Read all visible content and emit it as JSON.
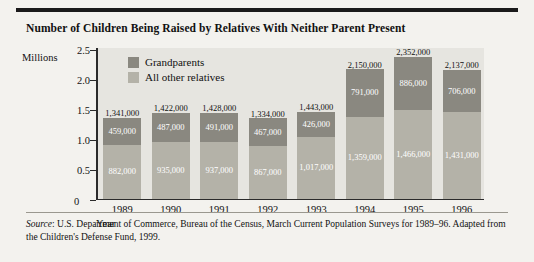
{
  "chart_data": {
    "type": "bar",
    "stacked": true,
    "title": "Number of Children Being Raised by Relatives With Neither Parent Present",
    "xlabel": "Year",
    "ylabel": "Millions",
    "ylim": [
      0,
      2.5
    ],
    "yticks": [
      "0",
      "0.5",
      "1.0",
      "1.5",
      "2.0",
      "2.5"
    ],
    "ytick_values": [
      0,
      0.5,
      1.0,
      1.5,
      2.0,
      2.5
    ],
    "grid": false,
    "legend_position": "inside-top-left",
    "categories": [
      "1989",
      "1990",
      "1991",
      "1992",
      "1993",
      "1994",
      "1995",
      "1996"
    ],
    "series": [
      {
        "name": "Grandparents",
        "color": "#8a8880",
        "values": [
          882000,
          935000,
          937000,
          867000,
          1017000,
          1359000,
          1466000,
          1431000
        ],
        "labels": [
          "882,000",
          "935,000",
          "937,000",
          "867,000",
          "1,017,000",
          "1,359,000",
          "1,466,000",
          "1,431,000"
        ]
      },
      {
        "name": "All other relatives",
        "color": "#b4b2a8",
        "values": [
          459000,
          487000,
          491000,
          467000,
          426000,
          791000,
          886000,
          706000
        ],
        "labels": [
          "459,000",
          "487,000",
          "491,000",
          "467,000",
          "426,000",
          "791,000",
          "886,000",
          "706,000"
        ]
      }
    ],
    "totals": [
      1341000,
      1422000,
      1428000,
      1334000,
      1443000,
      2150000,
      2352000,
      2137000
    ],
    "total_labels": [
      "1,341,000",
      "1,422,000",
      "1,428,000",
      "1,334,000",
      "1,443,000",
      "2,150,000",
      "2,352,000",
      "2,137,000"
    ],
    "zero_label": "0"
  },
  "source": {
    "prefix": "Source",
    "text": ": U.S. Department of Commerce, Bureau of the Census, March Current Population Surveys for 1989–96. Adapted from the Children's Defense Fund, 1999."
  }
}
